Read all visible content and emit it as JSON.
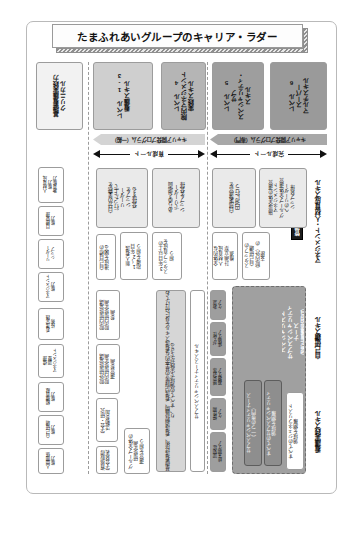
{
  "title": "たまふれあいグループのキャリア・ラダー",
  "levels": [
    {
      "id": "level-0",
      "label": "基礎看護実践力\nクリニカル",
      "fill": "#f2f2f2"
    },
    {
      "id": "level-1-3",
      "label": "レベル 1-3\n看護スキル",
      "fill": "#cfcfcf"
    },
    {
      "id": "level-4",
      "label": "レベル 4\n院内マネジメント\n実践スキル",
      "fill": "#b5b5b5"
    },
    {
      "id": "level-5",
      "label": "レベル 5\nサブ\nスペシャリティ・\nスキル",
      "fill": "#9e9e9e"
    },
    {
      "id": "level-6",
      "label": "レベル 6\nスーパー\nマルチスキル",
      "fill": "#9a9a9a"
    }
  ],
  "bands": [
    {
      "id": "band-general",
      "label": "キャリア開発プログラム（一般）",
      "fill": "#d4d4d4"
    },
    {
      "id": "band-specialty",
      "label": "キャリア開発プログラム（専門）",
      "fill": "#a8a8a8"
    }
  ],
  "arrows": [
    {
      "id": "arrow-development",
      "label": "育成ルート"
    },
    {
      "id": "arrow-completion",
      "label": "完成ルート"
    }
  ],
  "groups": [
    {
      "id": "group-management",
      "label": "マネジメント・人材育成スキル"
    },
    {
      "id": "group-self",
      "label": "自己研鑽スキル"
    },
    {
      "id": "group-nursing",
      "label": "看護実践スキル"
    }
  ],
  "badges": [
    {
      "id": "badge-hr",
      "label": "管理・人材育成能力"
    },
    {
      "id": "badge-generalist",
      "label": "ジェネラリスト"
    },
    {
      "id": "badge-specialist",
      "label": "スペシャリスト"
    }
  ],
  "management_column": {
    "rows": [
      {
        "id": "mgmt-c0",
        "text": ""
      },
      {
        "id": "mgmt-c1",
        "text": "自分の業務を\n行った上で\nリーダー\nシップを\n発揮する"
      },
      {
        "id": "mgmt-c2",
        "text": "あらゆる場面\nでリーダー\nシップを発揮"
      },
      {
        "id": "mgmt-c3",
        "text": "自部署運営を\n円滑に行う"
      },
      {
        "id": "mgmt-c4",
        "text": "施設全体の運営\nマネジメント\nグループ全体運営\nへのリーダー\nシップ発揮"
      }
    ]
  },
  "management_sub": {
    "rows": [
      {
        "id": "mgmt-s1",
        "text": "新人看護\n1～2年目\n指導を担う"
      },
      {
        "id": "mgmt-s2",
        "text": "3年目以上の\nスタッフ育成を\n担う"
      },
      {
        "id": "mgmt-s3",
        "text": "全体的な\n人材育成\n計画立案\n推進"
      },
      {
        "id": "mgmt-s4",
        "text": "スタッフの\n自己研鑽\n（院内外）の\n支援"
      }
    ]
  },
  "self_column": {
    "rows": [
      {
        "id": "self-1",
        "text": "自己目標の\n達成を図る"
      },
      {
        "id": "self-2",
        "text": "院内研修受講\n院内研修企画\n参画"
      },
      {
        "id": "self-3",
        "text": "院外研修受講\n院内研修企画\n運営参画"
      },
      {
        "id": "self-4",
        "text": "学会・研究\n活動参加"
      },
      {
        "id": "self-5",
        "text": "資格取得\n学会発表"
      },
      {
        "id": "self-6",
        "text": "グループ全体の\n研修企画\n運営を担う"
      }
    ]
  },
  "nursing_column": {
    "basic": "基礎看護技術、看護過程展開、看護記録等の基本的な看護スキルを身に付けており、すべての領域で実践ができる",
    "sub_label": "サブスペシャリティナーススキル",
    "specialties": [
      {
        "id": "sp-1",
        "text": "救急\nケア"
      },
      {
        "id": "sp-2",
        "text": "がん性\n疼痛ケア"
      },
      {
        "id": "sp-3",
        "text": "感染対策\n褥瘡ケア"
      },
      {
        "id": "sp-4",
        "text": "慢性期\nケア"
      },
      {
        "id": "sp-5",
        "text": "認知症\n終末期ケア"
      }
    ]
  },
  "specialist_block": {
    "title": "スペシャリスト\nサブスペシャリティ\nナース\n（認定看護師相当）",
    "items": [
      {
        "id": "spec-all",
        "text": "すべてのサブスペシャリティ\n領域を網羅"
      },
      {
        "id": "spec-one",
        "text": "サブスペシャリティナース\n（一つの専門）"
      }
    ]
  },
  "generalist_block": {
    "title": "ジェネラリスト",
    "items": [
      {
        "id": "gen-1",
        "text": "すべてのジェネラリスト\n領域を網羅"
      }
    ]
  },
  "left_labels": [
    {
      "id": "ll-1",
      "text": "人材育成\n能力\n教育能力"
    },
    {
      "id": "ll-2",
      "text": "目標管理\n能力"
    },
    {
      "id": "ll-3",
      "text": "リーダー\nシップ"
    },
    {
      "id": "ll-4",
      "text": "マネジメント\n能力"
    },
    {
      "id": "ll-5",
      "text": "看護実践\n技術"
    },
    {
      "id": "ll-6",
      "text": "倫理\n調整\nマネジメント"
    },
    {
      "id": "ll-7",
      "text": "組織貢献\n能力"
    },
    {
      "id": "ll-8",
      "text": "自己研鑽\n能力"
    },
    {
      "id": "ll-9",
      "text": "人間関係\n能力"
    }
  ],
  "colors": {
    "frame": "#b9b9b9",
    "band_general": "#d4d4d4",
    "band_specialty": "#a8a8a8",
    "dark": "#1c1c1c",
    "mid_gray": "#9e9e9e",
    "light_gray": "#e6e6e6"
  }
}
